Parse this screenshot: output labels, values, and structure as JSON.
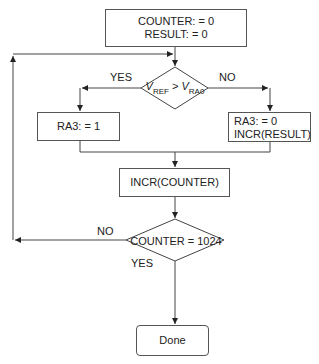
{
  "init_box": {
    "line1": "COUNTER: = 0",
    "line2": "RESULT: = 0"
  },
  "decision1": {
    "v": "V",
    "sub_ref": "REF",
    "op": " > ",
    "sub_ra": "RA0",
    "yes": "YES",
    "no": "NO"
  },
  "yes_box": {
    "line1": "RA3: = 1"
  },
  "no_box": {
    "line1": "RA3: = 0",
    "line2": "INCR(RESULT)"
  },
  "incr_box": {
    "line1": "INCR(COUNTER)"
  },
  "decision2": {
    "text": "COUNTER = 1024",
    "no": "NO",
    "yes": "YES"
  },
  "done_box": {
    "label": "Done"
  },
  "colors": {
    "line": "#333333",
    "background": "#ffffff"
  }
}
